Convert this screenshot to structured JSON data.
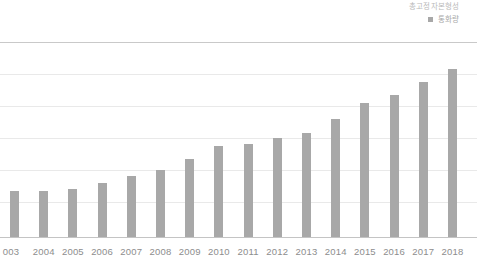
{
  "legend": {
    "items": [
      {
        "label": "총고정자본형성",
        "marker": "none",
        "color": "#b9b9b9"
      },
      {
        "label": "통화량",
        "marker": "square",
        "color": "#a8a8a8"
      }
    ]
  },
  "chart_data": {
    "type": "bar",
    "title": "",
    "xlabel": "",
    "ylabel": "",
    "grid": true,
    "legend_position": "top-right",
    "series_name": "통화량",
    "bar_color": "#a8a8a8",
    "gridline_color": "#e9e9e9",
    "axis_color": "#c4c4c4",
    "categories": [
      "2003",
      "2004",
      "2005",
      "2006",
      "2007",
      "2008",
      "2009",
      "2010",
      "2011",
      "2012",
      "2013",
      "2014",
      "2015",
      "2016",
      "2017",
      "2018"
    ],
    "first_category_clipped_text": "003",
    "values": [
      29,
      29,
      30,
      34,
      38,
      42,
      49,
      57,
      58,
      62,
      65,
      74,
      84,
      89,
      97,
      105
    ],
    "ylim": [
      0,
      130
    ],
    "ytick_values": [
      0,
      20,
      40,
      60,
      80,
      100,
      120
    ],
    "ytick_labels_visible": false
  }
}
